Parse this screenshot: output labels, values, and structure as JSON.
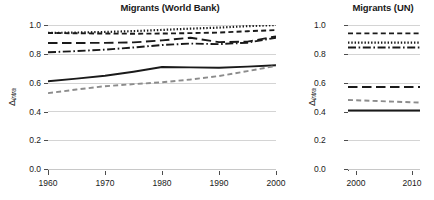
{
  "figure": {
    "width": 434,
    "height": 200,
    "background": "#ffffff"
  },
  "axis": {
    "y_label_delta": "Δ",
    "y_label_sub": "intra",
    "y_ticks": [
      "0.0",
      "0.2",
      "0.4",
      "0.6",
      "0.8",
      "1.0"
    ],
    "y_tick_values": [
      0.0,
      0.2,
      0.4,
      0.6,
      0.8,
      1.0
    ],
    "x_ticks_left": [
      "1960",
      "1970",
      "1980",
      "1990",
      "2000"
    ],
    "x_ticks_right": [
      "2000",
      "2010"
    ]
  },
  "colors": {
    "black": "#1a1a1a",
    "gray": "#8c8c8c",
    "grid": "#d4d4d4",
    "axis": "#4d4d4d"
  },
  "panels": {
    "left": {
      "title": "Migrants (World Bank)"
    },
    "right": {
      "title": "Migrants (UN)"
    }
  },
  "chart_data": [
    {
      "type": "line",
      "title": "Migrants (World Bank)",
      "xlabel": "",
      "ylabel": "Δ intra",
      "xlim": [
        1960,
        2000
      ],
      "ylim": [
        0.0,
        1.0
      ],
      "grid": true,
      "legend": "none",
      "x": [
        1960,
        1965,
        1970,
        1975,
        1980,
        1985,
        1990,
        1995,
        2000
      ],
      "series": [
        {
          "name": "dotted-upper",
          "style": "dotted",
          "color": "#1a1a1a",
          "values": [
            0.945,
            0.948,
            0.952,
            0.958,
            0.966,
            0.975,
            0.982,
            0.992,
            1.0
          ]
        },
        {
          "name": "dashed-upper",
          "style": "dashed",
          "color": "#1a1a1a",
          "values": [
            0.945,
            0.943,
            0.941,
            0.94,
            0.941,
            0.944,
            0.948,
            0.957,
            0.965
          ]
        },
        {
          "name": "long-dash-upper",
          "style": "long-dash",
          "color": "#1a1a1a",
          "values": [
            0.876,
            0.876,
            0.877,
            0.88,
            0.894,
            0.912,
            0.882,
            0.885,
            0.922
          ]
        },
        {
          "name": "dash-dot-upper",
          "style": "dash-dot",
          "color": "#1a1a1a",
          "values": [
            0.812,
            0.82,
            0.83,
            0.845,
            0.862,
            0.872,
            0.868,
            0.878,
            0.912
          ]
        },
        {
          "name": "solid-lower",
          "style": "solid",
          "color": "#1a1a1a",
          "values": [
            0.612,
            0.63,
            0.65,
            0.678,
            0.71,
            0.708,
            0.705,
            0.713,
            0.722
          ]
        },
        {
          "name": "dashed-gray-lower",
          "style": "dashed",
          "color": "#8c8c8c",
          "values": [
            0.53,
            0.555,
            0.578,
            0.592,
            0.605,
            0.624,
            0.648,
            0.682,
            0.718
          ]
        }
      ]
    },
    {
      "type": "line",
      "title": "Migrants (UN)",
      "xlabel": "",
      "ylabel": "Δ intra",
      "xlim": [
        2000,
        2010
      ],
      "ylim": [
        0.0,
        1.0
      ],
      "grid": true,
      "legend": "none",
      "x": [
        2000,
        2010
      ],
      "series": [
        {
          "name": "dashed-upper",
          "style": "dashed",
          "color": "#1a1a1a",
          "values": [
            0.942,
            0.942
          ]
        },
        {
          "name": "dotted-upper",
          "style": "dotted",
          "color": "#1a1a1a",
          "values": [
            0.878,
            0.878
          ]
        },
        {
          "name": "dash-dot-upper",
          "style": "dash-dot",
          "color": "#1a1a1a",
          "values": [
            0.845,
            0.845
          ]
        },
        {
          "name": "long-dash-mid",
          "style": "long-dash",
          "color": "#1a1a1a",
          "values": [
            0.572,
            0.572
          ]
        },
        {
          "name": "dashed-gray-mid",
          "style": "dashed",
          "color": "#8c8c8c",
          "values": [
            0.483,
            0.465
          ]
        },
        {
          "name": "solid-lower",
          "style": "solid",
          "color": "#1a1a1a",
          "values": [
            0.41,
            0.41
          ]
        }
      ]
    }
  ]
}
